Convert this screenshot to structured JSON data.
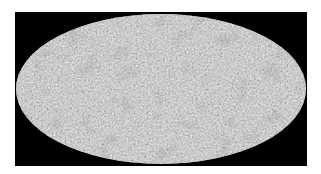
{
  "map": {
    "title": "",
    "projection": "mollweide",
    "description": "All-sky grayscale fluctuation map on black background",
    "colors": {
      "background": "#000000",
      "page": "#ffffff",
      "mid_gray": "#a8a8a8",
      "dark_spot": "#555555",
      "light_spot": "#d0d0d0"
    }
  }
}
